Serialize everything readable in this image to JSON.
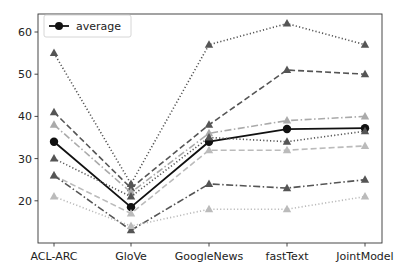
{
  "chart_data": {
    "type": "line",
    "title": "",
    "xlabel": "",
    "ylabel": "",
    "categories": [
      "ACL-ARC",
      "GloVe",
      "GoogleNews",
      "fastText",
      "JointModel"
    ],
    "ylim": [
      10.5,
      64
    ],
    "yticks": [
      20,
      30,
      40,
      50,
      60
    ],
    "grid": false,
    "legend": {
      "position": "upper left",
      "entries": [
        "average"
      ]
    },
    "series": [
      {
        "name": "series-1",
        "color": "#555555",
        "linestyle": "dotted",
        "marker": "triangle",
        "values": [
          55,
          24,
          57,
          62,
          57
        ]
      },
      {
        "name": "series-2",
        "color": "#555555",
        "linestyle": "dashed",
        "marker": "triangle",
        "values": [
          41,
          23,
          38,
          51,
          50
        ]
      },
      {
        "name": "series-3",
        "color": "#aaaaaa",
        "linestyle": "dashdot",
        "marker": "triangle",
        "values": [
          38,
          22,
          36,
          39,
          40
        ]
      },
      {
        "name": "average",
        "color": "#111111",
        "linestyle": "solid",
        "marker": "circle",
        "values": [
          34,
          18.5,
          34,
          37,
          37.2
        ]
      },
      {
        "name": "series-4",
        "color": "#555555",
        "linestyle": "dotted",
        "marker": "triangle",
        "values": [
          30,
          21,
          35,
          34,
          36.5
        ]
      },
      {
        "name": "series-5",
        "color": "#bbbbbb",
        "linestyle": "dashed",
        "marker": "triangle",
        "values": [
          26,
          17,
          32,
          32,
          33
        ]
      },
      {
        "name": "series-6",
        "color": "#555555",
        "linestyle": "dashdot",
        "marker": "triangle",
        "values": [
          26,
          13,
          24,
          23,
          25
        ]
      },
      {
        "name": "series-7",
        "color": "#bbbbbb",
        "linestyle": "dotted",
        "marker": "triangle",
        "values": [
          21,
          14,
          18,
          18,
          21
        ]
      }
    ]
  }
}
